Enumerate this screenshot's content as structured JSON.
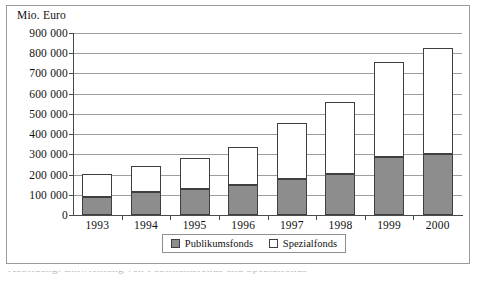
{
  "chart_data": {
    "type": "bar",
    "title": "",
    "subtitle": "",
    "unit_label": "Mio. Euro",
    "xlabel": "",
    "ylabel": "",
    "stacked": true,
    "grid": true,
    "legend_position": "bottom",
    "categories": [
      "1993",
      "1994",
      "1995",
      "1996",
      "1997",
      "1998",
      "1999",
      "2000"
    ],
    "ylim": [
      0,
      900000
    ],
    "ytick_labels": [
      "900 000",
      "800 000",
      "700 000",
      "600 000",
      "500 000",
      "400 000",
      "300 000",
      "200 000",
      "100 000",
      "0"
    ],
    "ytick_values": [
      900000,
      800000,
      700000,
      600000,
      500000,
      400000,
      300000,
      200000,
      100000,
      0
    ],
    "series": [
      {
        "name": "Publikumsfonds",
        "color": "#8d8d8d",
        "values": [
          90000,
          115000,
          128000,
          150000,
          178000,
          205000,
          285000,
          300000
        ]
      },
      {
        "name": "Spezialfonds",
        "color": "#ffffff",
        "values": [
          115000,
          125000,
          152000,
          188000,
          275000,
          355000,
          470000,
          525000
        ]
      }
    ],
    "totals": [
      205000,
      240000,
      280000,
      338000,
      453000,
      560000,
      755000,
      825000
    ]
  },
  "legend": {
    "entries": [
      {
        "label": "Publikumsfonds",
        "swatch": "gray"
      },
      {
        "label": "Spezialfonds",
        "swatch": "white"
      }
    ]
  },
  "caption": {
    "text": "Abbildung: Entwicklung von Publikumsfonds und Spezialfonds"
  }
}
